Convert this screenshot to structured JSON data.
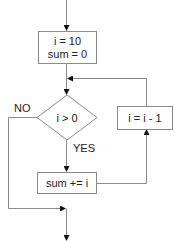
{
  "diagram": {
    "type": "flowchart",
    "nodes": {
      "init": {
        "line1": "i = 10",
        "line2": "sum = 0"
      },
      "condition": {
        "label": "i > 0"
      },
      "accumulate": {
        "label": "sum += i"
      },
      "decrement": {
        "label": "i = i - 1"
      }
    },
    "edge_labels": {
      "no": "NO",
      "yes": "YES"
    },
    "colors": {
      "stroke": "#8a8a8a",
      "arrow": "#111111",
      "text": "#222222",
      "background": "#ffffff"
    }
  }
}
